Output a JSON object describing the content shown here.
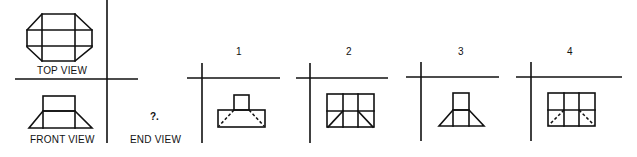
{
  "figure": {
    "line_color": "#111111",
    "background": "#ffffff"
  },
  "given_views": {
    "top_view_label": "TOP VIEW",
    "front_view_label": "FRONT VIEW",
    "end_view_label": "END VIEW",
    "unknown_marker": "?."
  },
  "options": [
    {
      "label": "1",
      "description": "Small square on top of wide rectangle, dashed diagonals in lower rectangle"
    },
    {
      "label": "2",
      "description": "Rectangle divided into 3x2 grid, solid diagonals in lower outer cells"
    },
    {
      "label": "3",
      "description": "Small square on top of trapezoid with two inner vertical lines"
    },
    {
      "label": "4",
      "description": "Rectangle divided into 3x2 grid, dashed diagonals in lower outer cells"
    }
  ]
}
